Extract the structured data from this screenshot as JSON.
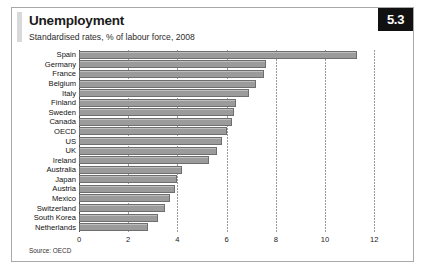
{
  "figure": {
    "title": "Unemployment",
    "subtitle": "Standardised rates, % of labour force, 2008",
    "page_number": "5.3",
    "source": "Source: OECD",
    "accent_color": "#d9d9d9",
    "bar_color": "#9b9b9b",
    "badge_background": "#111111",
    "badge_text_color": "#ffffff",
    "frame_color": "#a8a8a8"
  },
  "chart_data": {
    "type": "bar",
    "orientation": "horizontal",
    "title": "Unemployment",
    "subtitle": "Standardised rates, % of labour force, 2008",
    "xlabel": "",
    "ylabel": "",
    "xlim": [
      0,
      12.6
    ],
    "xticks": [
      0,
      2,
      4,
      6,
      8,
      10,
      12
    ],
    "xtick_labels": [
      "0",
      "2",
      "4",
      "6",
      "8",
      "10",
      "12"
    ],
    "grid": true,
    "grid_style": "dotted-vertical",
    "legend": false,
    "source": "Source: OECD",
    "categories": [
      "Spain",
      "Germany",
      "France",
      "Belgium",
      "Italy",
      "Finland",
      "Sweden",
      "Canada",
      "OECD",
      "US",
      "UK",
      "Ireland",
      "Australia",
      "Japan",
      "Austria",
      "Mexico",
      "Switzerland",
      "South Korea",
      "Netherlands"
    ],
    "values": [
      11.3,
      7.6,
      7.5,
      7.2,
      6.9,
      6.4,
      6.3,
      6.2,
      6.0,
      5.8,
      5.6,
      5.3,
      4.2,
      4.0,
      3.9,
      3.7,
      3.5,
      3.2,
      2.8
    ]
  }
}
